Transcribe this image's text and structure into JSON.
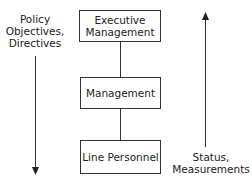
{
  "diagram": {
    "nodes": [
      {
        "id": "executive",
        "label_line1": "Executive",
        "label_line2": "Management"
      },
      {
        "id": "management",
        "label": "Management"
      },
      {
        "id": "line-personnel",
        "label": "Line Personnel"
      }
    ],
    "edges": [
      {
        "from": "executive",
        "to": "management"
      },
      {
        "from": "management",
        "to": "line-personnel"
      }
    ],
    "left_flow": {
      "direction": "down",
      "label_line1": "Policy",
      "label_line2": "Objectives,",
      "label_line3": "Directives"
    },
    "right_flow": {
      "direction": "up",
      "label_line1": "Status,",
      "label_line2": "Measurements"
    },
    "colors": {
      "stroke": "#333333",
      "text": "#222222",
      "background": "#ffffff"
    }
  }
}
